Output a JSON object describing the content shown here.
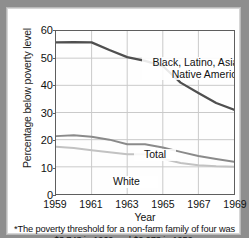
{
  "figure": {
    "frame_color": "#8e8e8e",
    "card_color": "#ffffff"
  },
  "chart_data": {
    "type": "line",
    "title": "",
    "xlabel": "Year",
    "ylabel": "Percentage below poverty level",
    "xlim": [
      1959,
      1969
    ],
    "ylim": [
      0,
      60
    ],
    "ytick_labels": [
      "0",
      "10",
      "20",
      "30",
      "40",
      "50",
      "60"
    ],
    "ytick_values": [
      0,
      10,
      20,
      30,
      40,
      50,
      60
    ],
    "xtick_labels": [
      "1959",
      "1961",
      "1963",
      "1965",
      "1967",
      "1969"
    ],
    "xtick_values": [
      1959,
      1961,
      1963,
      1965,
      1967,
      1969
    ],
    "grid": true,
    "legend_position": "inline-labels",
    "x": [
      1959,
      1960,
      1961,
      1962,
      1963,
      1964,
      1965,
      1966,
      1967,
      1968,
      1969
    ],
    "series": [
      {
        "name": "Black, Latino, Asian, and Native American",
        "color": "#4f4f4f",
        "width": 2.3,
        "values": [
          55.8,
          55.9,
          55.8,
          53.0,
          50.4,
          49.0,
          47.1,
          41.0,
          37.2,
          33.5,
          31.0
        ]
      },
      {
        "name": "Total",
        "color": "#8a8a8a",
        "width": 2.0,
        "values": [
          21.3,
          21.6,
          21.1,
          20.0,
          18.3,
          18.3,
          17.1,
          15.5,
          14.0,
          12.9,
          11.9
        ]
      },
      {
        "name": "White",
        "color": "#c2c2c2",
        "width": 2.0,
        "values": [
          17.4,
          16.9,
          16.1,
          15.4,
          14.6,
          14.6,
          13.0,
          11.4,
          10.6,
          10.2,
          10.0
        ]
      }
    ],
    "annotations": [
      {
        "id": "minority",
        "text": "Black, Latino, Asian, and\nNative American"
      },
      {
        "id": "total",
        "text": "Total"
      },
      {
        "id": "white",
        "text": "White"
      }
    ]
  },
  "footnote": {
    "text": "*The poverty threshold for a non-farm family of four was  $3,743 in 1969 and $2,973 in 1959."
  }
}
